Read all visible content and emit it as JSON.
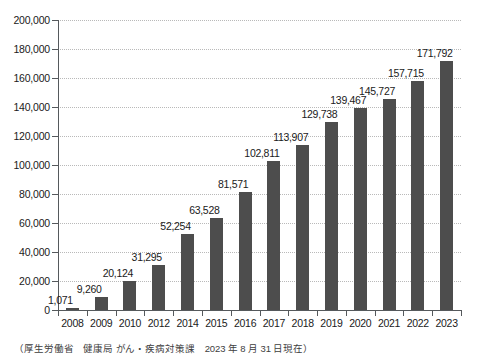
{
  "caption": "（厚生労働省　健康局 がん・疾病対策課　2023 年 8 月 31 日現在）",
  "chart_data": {
    "type": "bar",
    "title": "",
    "subtitle": "",
    "xlabel": "",
    "ylabel": "",
    "grid": true,
    "legend": "none",
    "bar_color": "#4d4d4d",
    "gridline_color": "#b9b9b9",
    "axis_color": "#55595c",
    "ylim": [
      0,
      200000
    ],
    "ytick_step": 20000,
    "ytick_labels": [
      "0",
      "20,000",
      "40,000",
      "60,000",
      "80,000",
      "100,000",
      "120,000",
      "140,000",
      "160,000",
      "180,000",
      "200,000"
    ],
    "ytick_values": [
      0,
      20000,
      40000,
      60000,
      80000,
      100000,
      120000,
      140000,
      160000,
      180000,
      200000
    ],
    "categories": [
      "2008",
      "2009",
      "2010",
      "2012",
      "2014",
      "2015",
      "2016",
      "2017",
      "2018",
      "2019",
      "2020",
      "2021",
      "2022",
      "2023"
    ],
    "values": [
      1071,
      9260,
      20124,
      31295,
      52254,
      63528,
      81571,
      102811,
      113907,
      129738,
      139467,
      145727,
      157715,
      171792
    ],
    "value_labels": [
      "1,071",
      "9,260",
      "20,124",
      "31,295",
      "52,254",
      "63,528",
      "81,571",
      "102,811",
      "113,907",
      "129,738",
      "139,467",
      "145,727",
      "157,715",
      "171,792"
    ]
  }
}
